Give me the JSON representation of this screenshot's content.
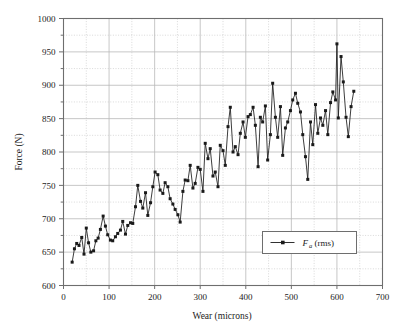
{
  "chart_data": {
    "type": "line",
    "title": "",
    "xlabel": "Wear (microns)",
    "ylabel": "Force (N)",
    "xlim": [
      0,
      700
    ],
    "ylim": [
      600,
      1000
    ],
    "x_major_step": 100,
    "x_minor_step": 50,
    "y_major_step": 50,
    "y_minor_step": 25,
    "xticks": [
      0,
      100,
      200,
      300,
      400,
      500,
      600,
      700
    ],
    "yticks": [
      600,
      650,
      700,
      750,
      800,
      850,
      900,
      950,
      1000
    ],
    "grid": "major-solid-minor-dotted",
    "legend_position": "lower-right-inside",
    "series": [
      {
        "name": "Fa (rms)",
        "name_base": "F",
        "name_sub": "a",
        "name_suffix": " (rms)",
        "marker": "square",
        "color": "#1a1a1a",
        "points": [
          [
            19,
            635
          ],
          [
            24,
            655
          ],
          [
            29,
            663
          ],
          [
            34,
            660
          ],
          [
            40,
            672
          ],
          [
            45,
            647
          ],
          [
            50,
            686
          ],
          [
            55,
            664
          ],
          [
            60,
            650
          ],
          [
            66,
            652
          ],
          [
            71,
            667
          ],
          [
            76,
            671
          ],
          [
            81,
            684
          ],
          [
            87,
            704
          ],
          [
            92,
            689
          ],
          [
            97,
            676
          ],
          [
            103,
            668
          ],
          [
            108,
            667
          ],
          [
            114,
            673
          ],
          [
            119,
            678
          ],
          [
            125,
            683
          ],
          [
            130,
            696
          ],
          [
            136,
            677
          ],
          [
            141,
            690
          ],
          [
            147,
            694
          ],
          [
            152,
            693
          ],
          [
            158,
            718
          ],
          [
            163,
            750
          ],
          [
            169,
            726
          ],
          [
            174,
            716
          ],
          [
            180,
            739
          ],
          [
            185,
            705
          ],
          [
            191,
            724
          ],
          [
            196,
            748
          ],
          [
            201,
            770
          ],
          [
            207,
            766
          ],
          [
            212,
            743
          ],
          [
            218,
            738
          ],
          [
            223,
            754
          ],
          [
            229,
            748
          ],
          [
            234,
            730
          ],
          [
            240,
            722
          ],
          [
            245,
            714
          ],
          [
            251,
            706
          ],
          [
            256,
            695
          ],
          [
            262,
            741
          ],
          [
            267,
            758
          ],
          [
            273,
            757
          ],
          [
            278,
            780
          ],
          [
            284,
            746
          ],
          [
            289,
            753
          ],
          [
            295,
            777
          ],
          [
            300,
            774
          ],
          [
            306,
            741
          ],
          [
            311,
            813
          ],
          [
            317,
            790
          ],
          [
            322,
            805
          ],
          [
            328,
            764
          ],
          [
            333,
            770
          ],
          [
            339,
            748
          ],
          [
            344,
            810
          ],
          [
            350,
            802
          ],
          [
            355,
            780
          ],
          [
            361,
            838
          ],
          [
            366,
            867
          ],
          [
            372,
            800
          ],
          [
            377,
            808
          ],
          [
            383,
            796
          ],
          [
            388,
            828
          ],
          [
            394,
            845
          ],
          [
            399,
            822
          ],
          [
            405,
            853
          ],
          [
            410,
            856
          ],
          [
            416,
            867
          ],
          [
            421,
            840
          ],
          [
            427,
            778
          ],
          [
            432,
            852
          ],
          [
            437,
            845
          ],
          [
            443,
            869
          ],
          [
            448,
            788
          ],
          [
            454,
            826
          ],
          [
            459,
            903
          ],
          [
            465,
            852
          ],
          [
            470,
            822
          ],
          [
            476,
            868
          ],
          [
            481,
            795
          ],
          [
            487,
            836
          ],
          [
            492,
            845
          ],
          [
            498,
            862
          ],
          [
            503,
            878
          ],
          [
            509,
            888
          ],
          [
            514,
            873
          ],
          [
            520,
            860
          ],
          [
            525,
            826
          ],
          [
            531,
            793
          ],
          [
            536,
            759
          ],
          [
            542,
            845
          ],
          [
            547,
            811
          ],
          [
            553,
            871
          ],
          [
            558,
            828
          ],
          [
            564,
            851
          ],
          [
            569,
            840
          ],
          [
            575,
            862
          ],
          [
            580,
            826
          ],
          [
            586,
            874
          ],
          [
            591,
            890
          ],
          [
            597,
            878
          ],
          [
            600,
            962
          ],
          [
            603,
            851
          ],
          [
            609,
            943
          ],
          [
            614,
            905
          ],
          [
            620,
            852
          ],
          [
            625,
            823
          ],
          [
            631,
            868
          ],
          [
            637,
            891
          ]
        ]
      }
    ]
  },
  "axes": {
    "x_tick_labels": [
      "0",
      "100",
      "200",
      "300",
      "400",
      "500",
      "600",
      "700"
    ],
    "y_tick_labels": [
      "600",
      "650",
      "700",
      "750",
      "800",
      "850",
      "900",
      "950",
      "1000"
    ],
    "x_title": "Wear (microns)",
    "y_title": "Force (N)"
  },
  "legend": {
    "entries": [
      {
        "base": "F",
        "sub": "a",
        "suffix": "(rms)",
        "marker": "square-line"
      }
    ]
  },
  "colors": {
    "line": "#1a1a1a",
    "marker": "#1a1a1a",
    "axis": "#6e6e6e",
    "grid_major": "#b9b9b9",
    "grid_minor": "#c9c9c9",
    "text": "#1b1b1b",
    "background": "#ffffff"
  }
}
